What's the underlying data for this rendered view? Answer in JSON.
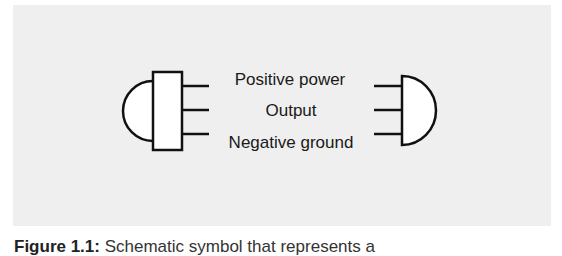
{
  "diagram": {
    "labels": {
      "positive": "Positive power",
      "output": "Output",
      "negative": "Negative ground"
    },
    "colors": {
      "panel_background": "#efefef",
      "stroke": "#111111",
      "fill": "#ffffff",
      "text": "#1a1a1a"
    }
  },
  "caption": {
    "figure_label": "Figure 1.1:",
    "text": "Schematic symbol that represents a"
  }
}
